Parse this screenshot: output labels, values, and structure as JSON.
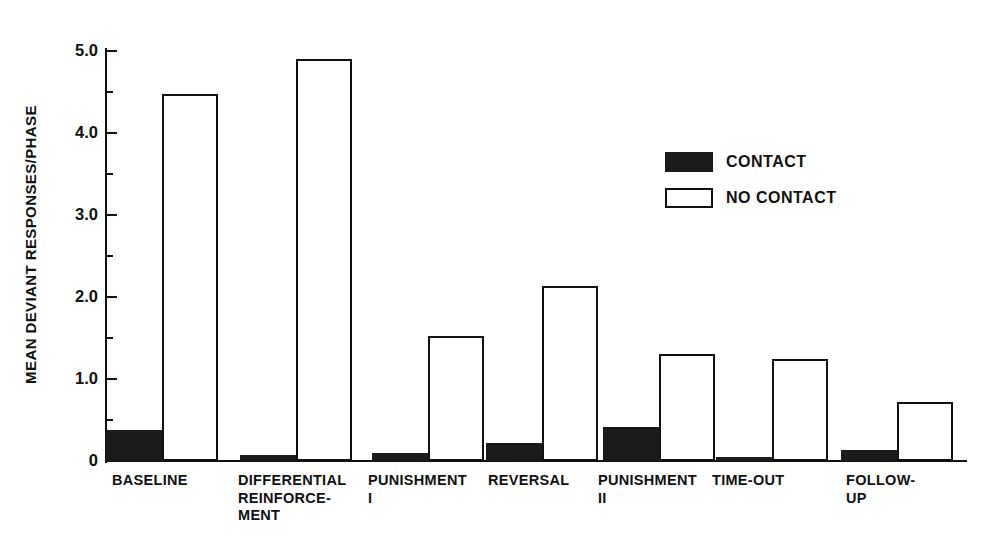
{
  "chart_data": {
    "type": "bar",
    "title": "",
    "xlabel": "",
    "ylabel": "MEAN DEVIANT RESPONSES/PHASE",
    "ylim": [
      0,
      5.2
    ],
    "grid": false,
    "legend_position": "upper-right",
    "y_ticks_major": [
      "0",
      "1.0",
      "2.0",
      "3.0",
      "4.0",
      "5.0"
    ],
    "y_tick_values_major": [
      0,
      1.0,
      2.0,
      3.0,
      4.0,
      5.0
    ],
    "y_tick_values_minor": [
      0.5,
      1.5,
      2.5,
      3.5,
      4.5
    ],
    "categories": [
      "BASELINE",
      "DIFFERENTIAL\nREINFORCE-\nMENT",
      "PUNISHMENT\nI",
      "REVERSAL",
      "PUNISHMENT\nII",
      "TIME-OUT",
      "FOLLOW-\nUP"
    ],
    "series": [
      {
        "name": "CONTACT",
        "color": "#1b1b1b",
        "values": [
          0.38,
          0.07,
          0.1,
          0.22,
          0.42,
          0.03,
          0.14
        ]
      },
      {
        "name": "NO CONTACT",
        "color": "#ffffff",
        "values": [
          4.48,
          4.9,
          1.52,
          2.13,
          1.31,
          1.25,
          0.72
        ]
      }
    ],
    "legend": [
      {
        "label": "CONTACT",
        "swatch": "filled"
      },
      {
        "label": "NO CONTACT",
        "swatch": "hollow"
      }
    ]
  },
  "layout": {
    "group_positions_px": [
      0,
      134,
      266,
      380,
      497,
      610,
      735
    ],
    "bar_width_px": 56,
    "label_offsets_px": [
      6,
      132,
      262,
      382,
      492,
      606,
      740
    ]
  }
}
